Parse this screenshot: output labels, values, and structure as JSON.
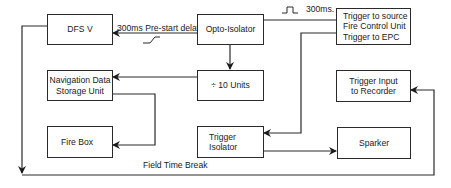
{
  "diagram": {
    "type": "block-diagram",
    "boxes": {
      "dfs": {
        "label": "DFS V"
      },
      "opto": {
        "label": "Opto-Isolator"
      },
      "trigger_source": {
        "line1": "Trigger to source",
        "line2": "Fire Control Unit",
        "line3": "Trigger to EPC"
      },
      "nav": {
        "line1": "Navigation Data",
        "line2": "Storage Unit"
      },
      "divide": {
        "label": "÷ 10 Units"
      },
      "trigger_input": {
        "line1": "Trigger Input",
        "line2": "to Recorder"
      },
      "firebox": {
        "label": "Fire Box"
      },
      "trigger_isolator": {
        "line1": "Trigger",
        "line2": "Isolator"
      },
      "sparker": {
        "label": "Sparker"
      }
    },
    "labels": {
      "prestart": "300ms Pre-start delay",
      "pulse_duration": "300ms.",
      "field_time_break": "Field Time Break"
    },
    "edges": [
      {
        "from": "Opto-Isolator",
        "to": "DFS V",
        "label": "300ms Pre-start delay"
      },
      {
        "from": "Opto-Isolator",
        "to": "÷ 10 Units"
      },
      {
        "from": "Opto-Isolator",
        "to": "Trigger to source / Fire Control Unit / Trigger to EPC",
        "label": "300ms."
      },
      {
        "from": "÷ 10 Units",
        "to": "Navigation Data Storage Unit"
      },
      {
        "from": "Navigation Data Storage Unit",
        "to": "Fire Box"
      },
      {
        "from": "Trigger to source / Fire Control Unit / Trigger to EPC",
        "to": "Trigger Isolator"
      },
      {
        "from": "Trigger Isolator",
        "to": "Sparker"
      },
      {
        "from": "DFS V",
        "to": "Trigger Input to Recorder",
        "label": "Field Time Break"
      }
    ],
    "colors": {
      "line": "#2a2a2a",
      "background": "#ffffff"
    }
  }
}
